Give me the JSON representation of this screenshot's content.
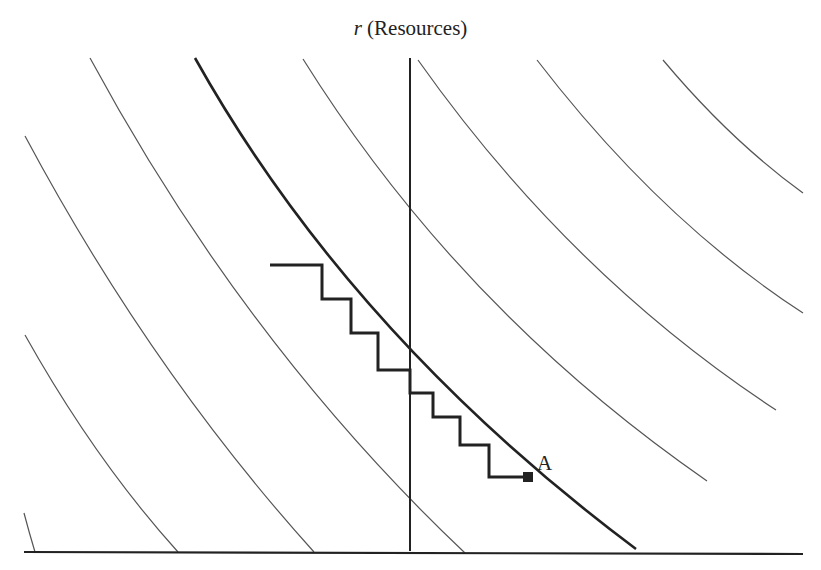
{
  "diagram": {
    "y_axis_var": "r",
    "y_axis_label": "(Resources)",
    "point_label": "A",
    "colors": {
      "line": "#222222",
      "thin": "#555555",
      "background": "#ffffff"
    },
    "indifference_curves": [
      {
        "id": "c0",
        "from": [
          24,
          513
        ],
        "to": [
          35,
          552
        ]
      },
      {
        "id": "c1",
        "from": [
          25,
          335
        ],
        "to": [
          178,
          552
        ]
      },
      {
        "id": "c2",
        "from": [
          25,
          136
        ],
        "to": [
          314,
          552
        ]
      },
      {
        "id": "c3",
        "from": [
          90,
          58
        ],
        "to": [
          465,
          553
        ]
      },
      {
        "id": "c-main",
        "from": [
          195,
          58
        ],
        "to": [
          636,
          549
        ],
        "bold": true
      },
      {
        "id": "c5",
        "from": [
          303,
          59
        ],
        "to": [
          707,
          481
        ]
      },
      {
        "id": "c6",
        "from": [
          418,
          60
        ],
        "to": [
          776,
          410
        ]
      },
      {
        "id": "c7",
        "from": [
          537,
          60
        ],
        "to": [
          803,
          313
        ]
      },
      {
        "id": "c8",
        "from": [
          663,
          60
        ],
        "to": [
          803,
          193
        ]
      }
    ],
    "staircase_points": [
      [
        270,
        265
      ],
      [
        322,
        265
      ],
      [
        322,
        299
      ],
      [
        351,
        299
      ],
      [
        351,
        333
      ],
      [
        378,
        333
      ],
      [
        378,
        370
      ],
      [
        410,
        370
      ],
      [
        410,
        393
      ],
      [
        433,
        393
      ],
      [
        433,
        417
      ],
      [
        460,
        417
      ],
      [
        460,
        445
      ],
      [
        489,
        445
      ],
      [
        489,
        477
      ],
      [
        528,
        477
      ]
    ],
    "point_A": [
      528,
      477
    ]
  }
}
